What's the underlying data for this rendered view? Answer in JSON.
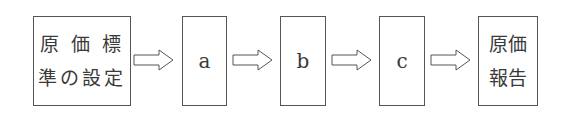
{
  "diagram": {
    "type": "flow",
    "nodes": [
      {
        "id": "start",
        "lines": [
          "原 価 標",
          "準の設定"
        ]
      },
      {
        "id": "a",
        "label": "a"
      },
      {
        "id": "b",
        "label": "b"
      },
      {
        "id": "c",
        "label": "c"
      },
      {
        "id": "end",
        "lines": [
          "原価",
          "報告"
        ]
      }
    ],
    "edges": [
      {
        "from": "start",
        "to": "a"
      },
      {
        "from": "a",
        "to": "b"
      },
      {
        "from": "b",
        "to": "c"
      },
      {
        "from": "c",
        "to": "end"
      }
    ],
    "colors": {
      "stroke": "#555555",
      "text": "#3a3a3a",
      "background": "#ffffff"
    }
  }
}
